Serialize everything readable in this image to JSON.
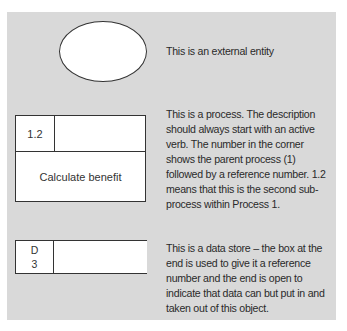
{
  "external_entity": {
    "description": "This is an external entity"
  },
  "process": {
    "reference": "1.2",
    "label": "Calculate benefit",
    "description": "This is a process. The description should always start with an active verb. The number in the corner shows the parent process (1) followed by a reference number. 1.2 means that this is the second sub-process within Process 1."
  },
  "data_store": {
    "reference_letter": "D",
    "reference_number": "3",
    "description": "This is a data store – the box at the end is used to give it a reference number and the end is open to indicate that data can but put in and taken out of this object."
  },
  "colors": {
    "panel_background": "#d9d9d9",
    "shape_fill": "#ffffff",
    "stroke": "#333333",
    "text": "#2a2a2a"
  }
}
